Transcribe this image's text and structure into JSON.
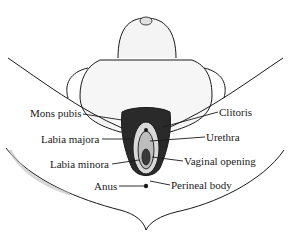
{
  "diagram": {
    "type": "anatomical-illustration",
    "view": "external genital anatomy, lithotomy view",
    "labels_left": [
      {
        "id": "mons-pubis",
        "text": "Mons pubis"
      },
      {
        "id": "labia-majora",
        "text": "Labia majora"
      },
      {
        "id": "labia-minora",
        "text": "Labia minora"
      },
      {
        "id": "anus",
        "text": "Anus"
      }
    ],
    "labels_right": [
      {
        "id": "clitoris",
        "text": "Clitoris"
      },
      {
        "id": "urethra",
        "text": "Urethra"
      },
      {
        "id": "vaginal-opening",
        "text": "Vaginal opening"
      },
      {
        "id": "perineal-body",
        "text": "Perineal body"
      }
    ],
    "colors": {
      "ink": "#1a1a1a",
      "background": "#ffffff",
      "shade": "#bdbdbd"
    }
  }
}
